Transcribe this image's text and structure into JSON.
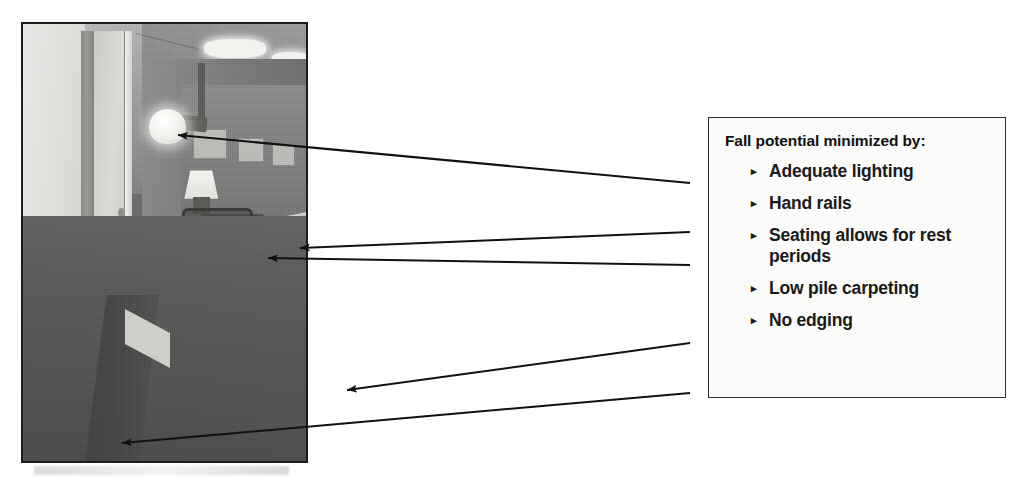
{
  "page": {
    "background": "#ffffff",
    "width": 1027,
    "height": 480
  },
  "photo": {
    "alt_description": "Grayscale photograph of a care-facility corridor with an open door on the left, a wall sconce, a table lamp, a wooden chair against the wall, hand rails on both walls, recessed ceiling lights, and low-pile dark carpeting.",
    "border_color": "#1c1c1c",
    "features": [
      "wall-sconce-light",
      "ceiling-light-panels",
      "table-lamp",
      "wooden-chair",
      "wall-hand-rail",
      "carpet-floor",
      "open-door"
    ]
  },
  "callout": {
    "title": "Fall potential minimized by:",
    "bullet_glyph": "▸",
    "border_color": "#2e2e2e",
    "background_color": "#fbfbfa",
    "text_color": "#1a1a1a",
    "items": [
      {
        "label": "Adequate lighting"
      },
      {
        "label": "Hand rails"
      },
      {
        "label": "Seating allows for rest periods"
      },
      {
        "label": "Low pile carpeting"
      },
      {
        "label": "No edging"
      }
    ]
  },
  "annotations": {
    "color": "#111111",
    "arrows": [
      {
        "name": "arrow-to-wall-sconce",
        "target": "Adequate lighting",
        "x1": 690,
        "y1": 183,
        "x2": 178,
        "y2": 135
      },
      {
        "name": "arrow-to-hand-rail",
        "target": "Hand rails",
        "x1": 690,
        "y1": 232,
        "x2": 300,
        "y2": 248
      },
      {
        "name": "arrow-to-chair",
        "target": "Seating allows for rest periods",
        "x1": 690,
        "y1": 265,
        "x2": 268,
        "y2": 258
      },
      {
        "name": "arrow-to-carpet",
        "target": "Low pile carpeting",
        "x1": 690,
        "y1": 343,
        "x2": 347,
        "y2": 390
      },
      {
        "name": "arrow-to-floor-edge",
        "target": "No edging",
        "x1": 690,
        "y1": 393,
        "x2": 122,
        "y2": 443
      }
    ]
  }
}
